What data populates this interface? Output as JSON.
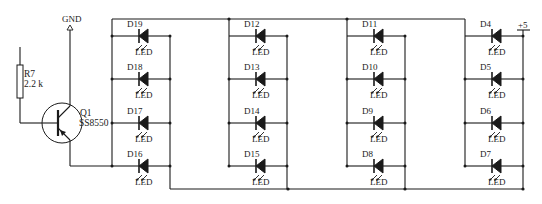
{
  "diagram": {
    "type": "circuit-schematic",
    "power": {
      "gnd_label": "GND",
      "vcc_label": "+5"
    },
    "resistor": {
      "ref": "R7",
      "value": "2.2 k"
    },
    "transistor": {
      "ref": "Q1",
      "part": "SS8550",
      "type": "PNP"
    },
    "led_type_label": "LED",
    "columns": [
      {
        "leds": [
          "D19",
          "D18",
          "D17",
          "D16"
        ]
      },
      {
        "leds": [
          "D12",
          "D13",
          "D14",
          "D15"
        ]
      },
      {
        "leds": [
          "D11",
          "D10",
          "D9",
          "D8"
        ]
      },
      {
        "leds": [
          "D4",
          "D5",
          "D6",
          "D7"
        ]
      }
    ]
  }
}
